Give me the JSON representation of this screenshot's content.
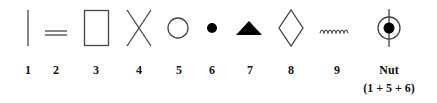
{
  "figure": {
    "symbols": [
      {
        "id": "1",
        "label": "1",
        "shape": "vertical-line"
      },
      {
        "id": "2",
        "label": "2",
        "shape": "double-horizontal-line"
      },
      {
        "id": "3",
        "label": "3",
        "shape": "rectangle"
      },
      {
        "id": "4",
        "label": "4",
        "shape": "cross-x"
      },
      {
        "id": "5",
        "label": "5",
        "shape": "open-circle"
      },
      {
        "id": "6",
        "label": "6",
        "shape": "filled-dot"
      },
      {
        "id": "7",
        "label": "7",
        "shape": "filled-triangle"
      },
      {
        "id": "8",
        "label": "8",
        "shape": "open-diamond"
      },
      {
        "id": "9",
        "label": "9",
        "shape": "wavy-line"
      },
      {
        "id": "nut",
        "label": "Nut",
        "sublabel": "(1 + 5 + 6)",
        "shape": "circle-dot-vertical-line"
      }
    ]
  }
}
